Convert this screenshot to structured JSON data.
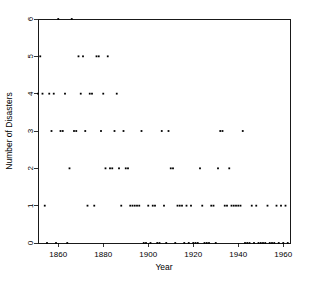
{
  "chart_data": {
    "type": "scatter",
    "title": "",
    "xlabel": "Year",
    "ylabel": "Number of Disasters",
    "xlim": [
      1851,
      1963
    ],
    "ylim": [
      0,
      6
    ],
    "grid": false,
    "legend": "none",
    "marker": "filled-square",
    "marker_size_px": 1.8,
    "xticks": [
      1860,
      1880,
      1900,
      1920,
      1940,
      1960
    ],
    "xtick_labels": [
      "1860",
      "1880",
      "1900",
      "1920",
      "1940",
      "1960"
    ],
    "yticks": [
      0,
      1,
      2,
      3,
      4,
      5,
      6
    ],
    "ytick_labels": [
      "0",
      "1",
      "2",
      "3",
      "4",
      "5",
      "6"
    ],
    "x": [
      1851,
      1852,
      1853,
      1854,
      1855,
      1856,
      1857,
      1858,
      1859,
      1860,
      1861,
      1862,
      1863,
      1864,
      1865,
      1866,
      1867,
      1868,
      1869,
      1870,
      1871,
      1872,
      1873,
      1874,
      1875,
      1876,
      1877,
      1878,
      1879,
      1880,
      1881,
      1882,
      1883,
      1884,
      1885,
      1886,
      1887,
      1888,
      1889,
      1890,
      1891,
      1892,
      1893,
      1894,
      1895,
      1896,
      1897,
      1898,
      1899,
      1900,
      1901,
      1902,
      1903,
      1904,
      1905,
      1906,
      1907,
      1908,
      1909,
      1910,
      1911,
      1912,
      1913,
      1914,
      1915,
      1916,
      1917,
      1918,
      1919,
      1920,
      1921,
      1922,
      1923,
      1924,
      1925,
      1926,
      1927,
      1928,
      1929,
      1930,
      1931,
      1932,
      1933,
      1934,
      1935,
      1936,
      1937,
      1938,
      1939,
      1940,
      1941,
      1942,
      1943,
      1944,
      1945,
      1946,
      1947,
      1948,
      1949,
      1950,
      1951,
      1952,
      1953,
      1954,
      1955,
      1956,
      1957,
      1958,
      1959,
      1960,
      1961,
      1962
    ],
    "y": [
      4,
      5,
      4,
      1,
      0,
      4,
      3,
      4,
      0,
      6,
      3,
      3,
      4,
      0,
      2,
      6,
      3,
      3,
      5,
      4,
      5,
      3,
      1,
      4,
      4,
      1,
      5,
      5,
      3,
      4,
      2,
      5,
      2,
      2,
      3,
      4,
      2,
      1,
      3,
      2,
      2,
      1,
      1,
      1,
      1,
      1,
      3,
      0,
      0,
      1,
      0,
      1,
      1,
      0,
      0,
      3,
      1,
      0,
      3,
      2,
      2,
      0,
      1,
      1,
      1,
      0,
      1,
      0,
      1,
      0,
      0,
      0,
      2,
      1,
      0,
      0,
      0,
      1,
      1,
      0,
      2,
      3,
      3,
      1,
      1,
      2,
      1,
      1,
      1,
      1,
      1,
      3,
      0,
      0,
      0,
      1,
      0,
      1,
      0,
      0,
      0,
      0,
      1,
      0,
      0,
      0,
      1,
      0,
      1,
      0,
      1,
      0
    ]
  }
}
